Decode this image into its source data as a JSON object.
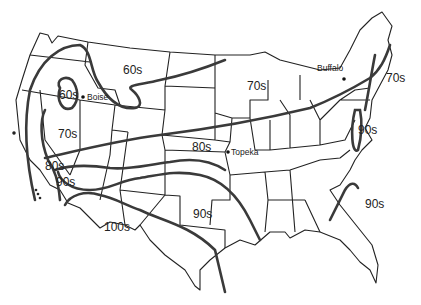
{
  "map": {
    "title": "",
    "band_labels": [
      {
        "id": "60s-north",
        "text": "60s"
      },
      {
        "id": "60s-boise",
        "text": "60s"
      },
      {
        "id": "70s-west",
        "text": "70s"
      },
      {
        "id": "70s-midwest",
        "text": "70s"
      },
      {
        "id": "70s-northeast",
        "text": "70s"
      },
      {
        "id": "80s-central",
        "text": "80s"
      },
      {
        "id": "80s-west",
        "text": "80s"
      },
      {
        "id": "90s-west",
        "text": "90s"
      },
      {
        "id": "90s-south",
        "text": "90s"
      },
      {
        "id": "90s-east",
        "text": "90s"
      },
      {
        "id": "90s-southeast",
        "text": "90s"
      },
      {
        "id": "100s-southwest",
        "text": "100s"
      }
    ],
    "cities": [
      {
        "id": "boise",
        "name": "Boise"
      },
      {
        "id": "topeka",
        "name": "Topeka"
      },
      {
        "id": "buffalo",
        "name": "Buffalo"
      }
    ],
    "colors": {
      "outline": "#222222",
      "isotherm": "#3a3a3a",
      "background": "#ffffff"
    }
  }
}
